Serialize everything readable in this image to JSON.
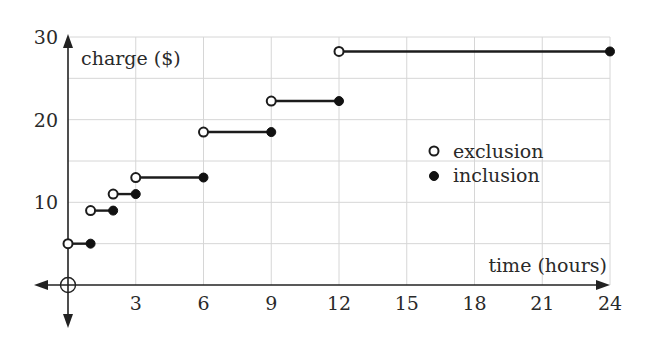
{
  "chart_data": {
    "type": "line",
    "subtype": "step-function",
    "title": "",
    "xlabel": "time (hours)",
    "ylabel": "charge ($)",
    "xlim": [
      0,
      24
    ],
    "ylim": [
      0,
      30
    ],
    "x_ticks": [
      3,
      6,
      9,
      12,
      15,
      18,
      21,
      24
    ],
    "y_ticks": [
      10,
      20,
      30
    ],
    "grid": {
      "on": true,
      "x_step": 3,
      "y_step": 5
    },
    "legend": {
      "position": "right-center",
      "entries": [
        {
          "marker": "open-circle",
          "label": "exclusion"
        },
        {
          "marker": "filled-circle",
          "label": "inclusion"
        }
      ]
    },
    "segments": [
      {
        "x_start": 0,
        "x_end": 1,
        "y": 5,
        "start": "exclusion",
        "end": "inclusion"
      },
      {
        "x_start": 1,
        "x_end": 2,
        "y": 9,
        "start": "exclusion",
        "end": "inclusion"
      },
      {
        "x_start": 2,
        "x_end": 3,
        "y": 11,
        "start": "exclusion",
        "end": "inclusion"
      },
      {
        "x_start": 3,
        "x_end": 6,
        "y": 13,
        "start": "exclusion",
        "end": "inclusion"
      },
      {
        "x_start": 6,
        "x_end": 9,
        "y": 18.5,
        "start": "exclusion",
        "end": "inclusion"
      },
      {
        "x_start": 9,
        "x_end": 12,
        "y": 22.25,
        "start": "exclusion",
        "end": "inclusion"
      },
      {
        "x_start": 12,
        "x_end": 24,
        "y": 28.25,
        "start": "exclusion",
        "end": "inclusion"
      }
    ],
    "origin_marker": "open-circle-with-crosshair"
  },
  "layout": {
    "x0_px": 68,
    "x24_px": 610,
    "y0_px": 285,
    "y30_px": 37
  },
  "colors": {
    "line": "#1c1c1c",
    "grid": "#d6d6d6",
    "text": "#2a2a2a",
    "background": "#ffffff"
  }
}
